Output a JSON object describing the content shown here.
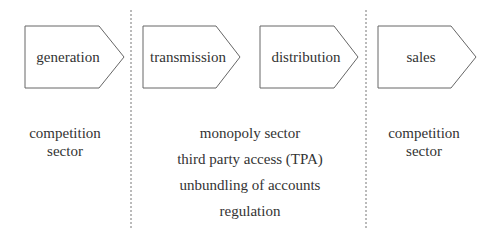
{
  "stages": [
    {
      "label": "generation"
    },
    {
      "label": "transmission"
    },
    {
      "label": "distribution"
    },
    {
      "label": "sales"
    }
  ],
  "sectors": {
    "left": {
      "line1": "competition",
      "line2": "sector"
    },
    "middle": [
      "monopoly sector",
      "third party access (TPA)",
      "unbundling of accounts",
      "regulation"
    ],
    "right": {
      "line1": "competition",
      "line2": "sector"
    }
  },
  "colors": {
    "stroke": "#555555",
    "text": "#333333",
    "divider": "#777777"
  }
}
